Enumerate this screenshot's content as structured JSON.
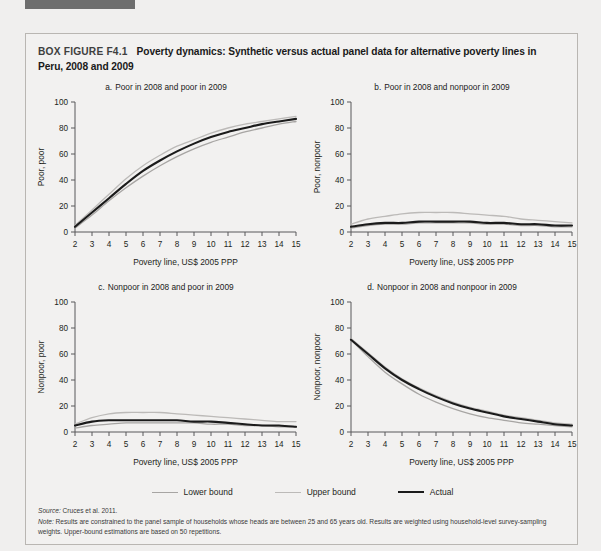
{
  "document": {
    "figure_tag": "BOX FIGURE F4.1",
    "title": "Poverty dynamics: Synthetic versus actual panel data for alternative poverty lines in Peru, 2008 and 2009",
    "source_label": "Source:",
    "source_text": " Cruces et al. 2011.",
    "note_label": "Note:",
    "note_text": " Results are constrained to the panel sample of households whose heads are between 25 and 65 years old. Results are weighted using household-level survey-sampling weights. Upper-bound estimations are based on 50 repetitions."
  },
  "legend": {
    "items": [
      {
        "label": "Lower bound",
        "color": "#a7a5a3"
      },
      {
        "label": "Upper bound",
        "color": "#bcbab8"
      },
      {
        "label": "Actual",
        "color": "#1b1b1b"
      }
    ]
  },
  "colors": {
    "page_background": "#f0efee",
    "box_background": "#f2f1f0",
    "box_border": "#b9b6b2",
    "axis": "#58595b",
    "text": "#231f20",
    "lower_bound": "#a7a5a3",
    "upper_bound": "#bcbab8",
    "actual": "#1b1b1b",
    "top_bar": "#6e6e6e"
  },
  "chart_data": [
    {
      "id": "a",
      "type": "line",
      "panel_letter": "a.",
      "title": "Poor in 2008 and poor in 2009",
      "xlabel": "Poverty line, US$ 2005 PPP",
      "ylabel": "Poor, poor",
      "x": [
        2,
        3,
        4,
        5,
        6,
        7,
        8,
        9,
        10,
        11,
        12,
        13,
        14,
        15
      ],
      "xlim": [
        2,
        15
      ],
      "ylim": [
        0,
        100
      ],
      "xticks": [
        2,
        3,
        4,
        5,
        6,
        7,
        8,
        9,
        10,
        11,
        12,
        13,
        14,
        15
      ],
      "yticks": [
        0,
        20,
        40,
        60,
        80,
        100
      ],
      "grid": false,
      "legend_position": "below-figure",
      "series": [
        {
          "name": "Lower bound",
          "values": [
            3,
            13,
            24,
            34,
            43,
            51,
            58,
            64,
            69,
            73,
            77,
            80,
            83,
            85
          ]
        },
        {
          "name": "Upper bound",
          "values": [
            5,
            17,
            29,
            41,
            51,
            59,
            66,
            71,
            76,
            80,
            83,
            85,
            87,
            89
          ]
        },
        {
          "name": "Actual",
          "values": [
            4,
            15,
            26,
            37,
            47,
            55,
            62,
            68,
            73,
            77,
            80,
            83,
            85,
            87
          ]
        }
      ]
    },
    {
      "id": "b",
      "type": "line",
      "panel_letter": "b.",
      "title": "Poor in 2008 and nonpoor in 2009",
      "xlabel": "Poverty line, US$ 2005 PPP",
      "ylabel": "Poor, nonpoor",
      "x": [
        2,
        3,
        4,
        5,
        6,
        7,
        8,
        9,
        10,
        11,
        12,
        13,
        14,
        15
      ],
      "xlim": [
        2,
        15
      ],
      "ylim": [
        0,
        100
      ],
      "xticks": [
        2,
        3,
        4,
        5,
        6,
        7,
        8,
        9,
        10,
        11,
        12,
        13,
        14,
        15
      ],
      "yticks": [
        0,
        20,
        40,
        60,
        80,
        100
      ],
      "grid": false,
      "legend_position": "below-figure",
      "series": [
        {
          "name": "Lower bound",
          "values": [
            3,
            5,
            6,
            6,
            7,
            7,
            7,
            7,
            6,
            6,
            5,
            5,
            4,
            4
          ]
        },
        {
          "name": "Upper bound",
          "values": [
            6,
            10,
            12,
            14,
            15,
            15,
            15,
            14,
            13,
            12,
            10,
            9,
            8,
            7
          ]
        },
        {
          "name": "Actual",
          "values": [
            4,
            6,
            7,
            7,
            8,
            8,
            8,
            8,
            7,
            7,
            6,
            6,
            5,
            5
          ]
        }
      ]
    },
    {
      "id": "c",
      "type": "line",
      "panel_letter": "c.",
      "title": "Nonpoor in 2008 and poor in 2009",
      "xlabel": "Poverty line, US$ 2005 PPP",
      "ylabel": "Nonpoor, poor",
      "x": [
        2,
        3,
        4,
        5,
        6,
        7,
        8,
        9,
        10,
        11,
        12,
        13,
        14,
        15
      ],
      "xlim": [
        2,
        15
      ],
      "ylim": [
        0,
        100
      ],
      "xticks": [
        2,
        3,
        4,
        5,
        6,
        7,
        8,
        9,
        10,
        11,
        12,
        13,
        14,
        15
      ],
      "yticks": [
        0,
        20,
        40,
        60,
        80,
        100
      ],
      "grid": false,
      "legend_position": "below-figure",
      "series": [
        {
          "name": "Lower bound",
          "values": [
            3,
            5,
            6,
            7,
            7,
            7,
            7,
            7,
            6,
            6,
            5,
            5,
            4,
            4
          ]
        },
        {
          "name": "Upper bound",
          "values": [
            6,
            11,
            14,
            15,
            15,
            15,
            14,
            13,
            12,
            11,
            10,
            9,
            8,
            8
          ]
        },
        {
          "name": "Actual",
          "values": [
            5,
            8,
            9,
            9,
            9,
            9,
            9,
            8,
            8,
            7,
            6,
            5,
            5,
            4
          ]
        }
      ]
    },
    {
      "id": "d",
      "type": "line",
      "panel_letter": "d.",
      "title": "Nonpoor in 2008 and nonpoor in 2009",
      "xlabel": "Poverty line, US$ 2005 PPP",
      "ylabel": "Nonpoor, nonpoor",
      "x": [
        2,
        3,
        4,
        5,
        6,
        7,
        8,
        9,
        10,
        11,
        12,
        13,
        14,
        15
      ],
      "xlim": [
        2,
        15
      ],
      "ylim": [
        0,
        100
      ],
      "xticks": [
        2,
        3,
        4,
        5,
        6,
        7,
        8,
        9,
        10,
        11,
        12,
        13,
        14,
        15
      ],
      "yticks": [
        0,
        20,
        40,
        60,
        80,
        100
      ],
      "grid": false,
      "legend_position": "below-figure",
      "series": [
        {
          "name": "Lower bound",
          "values": [
            71,
            58,
            46,
            37,
            29,
            23,
            18,
            14,
            11,
            9,
            7,
            6,
            5,
            4
          ]
        },
        {
          "name": "Upper bound",
          "values": [
            72,
            61,
            50,
            41,
            34,
            28,
            23,
            19,
            16,
            13,
            11,
            9,
            7,
            6
          ]
        },
        {
          "name": "Actual",
          "values": [
            71,
            60,
            49,
            40,
            33,
            27,
            22,
            18,
            15,
            12,
            10,
            8,
            6,
            5
          ]
        }
      ]
    }
  ]
}
